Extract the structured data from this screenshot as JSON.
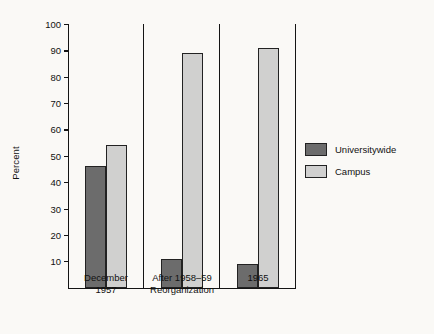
{
  "chart_data": {
    "type": "bar",
    "title": "",
    "xlabel": "",
    "ylabel": "Percent",
    "ylim": [
      0,
      100
    ],
    "ytick_step": 10,
    "yticks": [
      100,
      90,
      80,
      70,
      60,
      50,
      40,
      30,
      20,
      10
    ],
    "grid": false,
    "legend_position": "right",
    "categories": [
      "December\n1957",
      "After 1958–59\nReorganization",
      "1965"
    ],
    "category_labels": [
      {
        "line1": "December",
        "line2": "1957"
      },
      {
        "line1": "After 1958–59",
        "line2": "Reorganization"
      },
      {
        "line1": "1965",
        "line2": ""
      }
    ],
    "series": [
      {
        "name": "Universitywide",
        "color": "#6c6c6c",
        "values": [
          46,
          11,
          9
        ]
      },
      {
        "name": "Campus",
        "color": "#d0d0cf",
        "values": [
          54,
          89,
          91
        ]
      }
    ]
  },
  "legend": {
    "items": [
      {
        "label": "Universitywide",
        "swatch": "universitywide"
      },
      {
        "label": "Campus",
        "swatch": "campus"
      }
    ]
  },
  "axis": {
    "y_title": "Percent",
    "y_tick_labels": [
      "100",
      "90",
      "80",
      "70",
      "60",
      "50",
      "40",
      "30",
      "20",
      "10"
    ]
  },
  "colors": {
    "background": "#faf9f6",
    "axis": "#141414",
    "text": "#111111",
    "series_universitywide": "#6c6c6c",
    "series_campus": "#d0d0cf"
  }
}
